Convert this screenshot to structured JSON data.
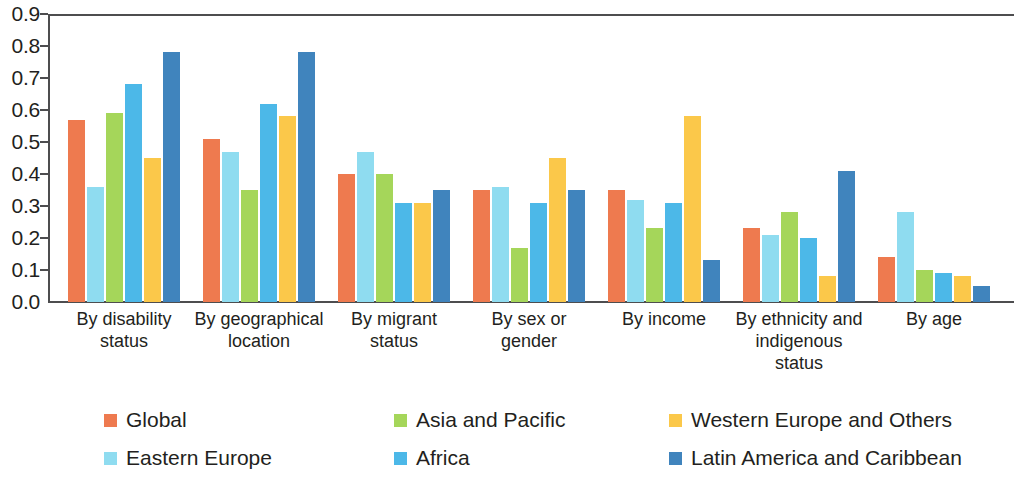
{
  "chart_data": {
    "type": "bar",
    "title": "",
    "subtitle": "",
    "xlabel": "",
    "ylabel": "",
    "ylim": [
      0.0,
      0.9
    ],
    "grid": false,
    "legend_position": "bottom",
    "y_ticks": [
      "0.0",
      "0.1",
      "0.2",
      "0.3",
      "0.4",
      "0.5",
      "0.6",
      "0.7",
      "0.8",
      "0.9"
    ],
    "categories": [
      "By disability status",
      "By geographical location",
      "By migrant status",
      "By sex or gender",
      "By income",
      "By ethnicity and indigenous status",
      "By age"
    ],
    "category_lines": [
      [
        "By disability",
        "status"
      ],
      [
        "By geographical",
        "location"
      ],
      [
        "By migrant",
        "status"
      ],
      [
        "By sex or",
        "gender"
      ],
      [
        "By income"
      ],
      [
        "By ethnicity and",
        "indigenous",
        "status"
      ],
      [
        "By age"
      ]
    ],
    "series": [
      {
        "name": "Global",
        "color": "#ee7a4f",
        "values": [
          0.57,
          0.51,
          0.4,
          0.35,
          0.35,
          0.23,
          0.14
        ]
      },
      {
        "name": "Eastern Europe",
        "color": "#8fdcf0",
        "values": [
          0.36,
          0.47,
          0.47,
          0.36,
          0.32,
          0.21,
          0.28
        ]
      },
      {
        "name": "Asia and Pacific",
        "color": "#a5d65a",
        "values": [
          0.59,
          0.35,
          0.4,
          0.17,
          0.23,
          0.28,
          0.1
        ]
      },
      {
        "name": "Africa",
        "color": "#4cb8e8",
        "values": [
          0.68,
          0.62,
          0.31,
          0.31,
          0.31,
          0.2,
          0.09
        ]
      },
      {
        "name": "Western Europe and Others",
        "color": "#fbc84a",
        "values": [
          0.45,
          0.58,
          0.31,
          0.45,
          0.58,
          0.08,
          0.08
        ]
      },
      {
        "name": "Latin America and Caribbean",
        "color": "#4084bd",
        "values": [
          0.78,
          0.78,
          0.35,
          0.35,
          0.13,
          0.41,
          0.05
        ]
      }
    ]
  },
  "legend": {
    "entries": [
      {
        "label": "Global",
        "color": "#ee7a4f"
      },
      {
        "label": "Eastern Europe",
        "color": "#8fdcf0"
      },
      {
        "label": "Asia and Pacific",
        "color": "#a5d65a"
      },
      {
        "label": "Africa",
        "color": "#4cb8e8"
      },
      {
        "label": "Western Europe and Others",
        "color": "#fbc84a"
      },
      {
        "label": "Latin America and Caribbean",
        "color": "#4084bd"
      }
    ]
  }
}
